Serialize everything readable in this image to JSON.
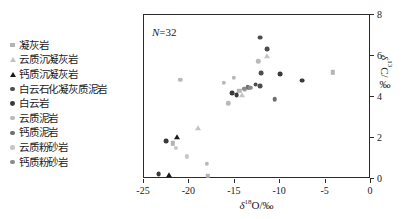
{
  "chart_data": {
    "type": "scatter",
    "title": "",
    "xlabel": "δ18O/‰",
    "ylabel": "δ13C/‰",
    "xlim": [
      -25,
      0
    ],
    "ylim": [
      0,
      8
    ],
    "xticks": [
      -25,
      -20,
      -15,
      -10,
      -5,
      0
    ],
    "xtick_labels": [
      "-25",
      "-20",
      "-15",
      "-10",
      "-5",
      "0"
    ],
    "yticks": [
      0,
      2,
      4,
      6,
      8
    ],
    "ytick_labels": [
      "0",
      "2",
      "4",
      "6",
      "8"
    ],
    "grid": false,
    "legend_position": "left-outside",
    "annotation": "N=32",
    "annotation_n": 32,
    "series": [
      {
        "name": "凝灰岩",
        "marker": "square",
        "color": "#b4b4b4",
        "size": 4.4,
        "points": [
          [
            -21.8,
            1.75
          ],
          [
            -18.0,
            0.15
          ],
          [
            -14.5,
            4.3
          ],
          [
            -4.2,
            5.2
          ]
        ]
      },
      {
        "name": "云质沉凝灰岩",
        "marker": "triangle",
        "color": "#c4c4c4",
        "size": 5.0,
        "points": [
          [
            -19.0,
            2.5
          ],
          [
            -14.2,
            4.1
          ],
          [
            -11.4,
            6.0
          ]
        ]
      },
      {
        "name": "钙质沉凝灰岩",
        "marker": "triangle",
        "color": "#1a1a1a",
        "size": 5.0,
        "points": [
          [
            -21.4,
            2.05
          ],
          [
            -22.3,
            0.2
          ]
        ]
      },
      {
        "name": "白云石化凝灰质泥岩",
        "marker": "circle",
        "color": "#4d4d4d",
        "size": 4.8,
        "points": [
          [
            -12.2,
            6.9
          ],
          [
            -11.4,
            6.35
          ],
          [
            -12.1,
            5.15
          ],
          [
            -12.7,
            4.6
          ],
          [
            -12.2,
            4.55
          ]
        ]
      },
      {
        "name": "白云岩",
        "marker": "circle",
        "color": "#3a3a3a",
        "size": 4.8,
        "points": [
          [
            -15.3,
            4.2
          ],
          [
            -14.8,
            4.1
          ],
          [
            -10.0,
            5.1
          ],
          [
            -7.6,
            4.8
          ],
          [
            -22.6,
            1.85
          ],
          [
            -23.4,
            0.25
          ]
        ]
      },
      {
        "name": "云质泥岩",
        "marker": "circle",
        "color": "#b9b9b9",
        "size": 4.4,
        "points": [
          [
            -21.0,
            4.85
          ],
          [
            -16.2,
            4.7
          ],
          [
            -15.1,
            4.95
          ],
          [
            -12.4,
            5.75
          ],
          [
            -15.7,
            3.7
          ],
          [
            -18.1,
            0.75
          ]
        ]
      },
      {
        "name": "钙质泥岩",
        "marker": "circle",
        "color": "#6e6e6e",
        "size": 4.6,
        "points": [
          [
            -13.6,
            4.5
          ],
          [
            -13.5,
            4.45
          ],
          [
            -10.6,
            3.9
          ]
        ]
      },
      {
        "name": "云质粉砂岩",
        "marker": "circle",
        "color": "#c6c6c6",
        "size": 4.2,
        "points": [
          [
            -13.9,
            4.35
          ],
          [
            -21.5,
            1.5
          ],
          [
            -20.3,
            1.1
          ]
        ]
      },
      {
        "name": "钙质粉砂岩",
        "marker": "circle",
        "color": "#8a8a8a",
        "size": 4.4,
        "points": [
          [
            -13.95,
            4.4
          ],
          [
            -13.3,
            4.45
          ]
        ]
      }
    ]
  },
  "legend": {
    "items": [
      {
        "label": "凝灰岩",
        "marker": "square",
        "color": "#b4b4b4",
        "size": 4.4
      },
      {
        "label": "云质沉凝灰岩",
        "marker": "triangle",
        "color": "#c4c4c4",
        "size": 5.0
      },
      {
        "label": "钙质沉凝灰岩",
        "marker": "triangle",
        "color": "#1a1a1a",
        "size": 5.0
      },
      {
        "label": "白云石化凝灰质泥岩",
        "marker": "circle",
        "color": "#4d4d4d",
        "size": 4.8
      },
      {
        "label": "白云岩",
        "marker": "circle",
        "color": "#3a3a3a",
        "size": 4.8
      },
      {
        "label": "云质泥岩",
        "marker": "circle",
        "color": "#b9b9b9",
        "size": 4.4
      },
      {
        "label": "钙质泥岩",
        "marker": "circle",
        "color": "#6e6e6e",
        "size": 4.6
      },
      {
        "label": "云质粉砂岩",
        "marker": "circle",
        "color": "#c6c6c6",
        "size": 4.2
      },
      {
        "label": "钙质粉砂岩",
        "marker": "circle",
        "color": "#8a8a8a",
        "size": 4.4
      }
    ]
  },
  "axis_label_parts": {
    "x_delta": "δ",
    "x_sup": "18",
    "x_rest": "O/‰",
    "y_delta": "δ",
    "y_sup": "13",
    "y_rest": "C/‰"
  }
}
